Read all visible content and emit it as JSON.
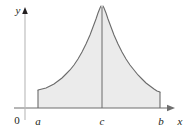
{
  "figure": {
    "background_color": "#ffffff",
    "axis_color": "#6f6f6f",
    "curve_color": "#6b6b6b",
    "fill_color": "#ebebeb",
    "label_color": "#231f20"
  },
  "axes": {
    "y_axis": {
      "label": "y",
      "has_arrow": true,
      "x_pixel": 25,
      "top_pixel": 7,
      "bottom_pixel": 120
    },
    "x_axis": {
      "label": "x",
      "has_arrow": true,
      "y_pixel": 108,
      "left_pixel": 14,
      "right_pixel": 175
    },
    "origin": {
      "label": "0"
    }
  },
  "tick_labels": [
    {
      "name": "a",
      "label": "a",
      "x_pixel": 38
    },
    {
      "name": "c",
      "label": "c",
      "x_pixel": 102
    },
    {
      "name": "b",
      "label": "b",
      "x_pixel": 160
    }
  ],
  "chart_data": {
    "type": "area",
    "title": "",
    "xlabel": "x",
    "ylabel": "y",
    "grid": false,
    "legend": null,
    "xlim": [
      25,
      175
    ],
    "ylim": [
      0,
      108
    ],
    "annotations": [
      {
        "text": "vertical asymptote at x = c",
        "x_pixel": 102
      },
      {
        "text": "shaded region from a to b",
        "x_pixel": 99
      }
    ],
    "asymptote": {
      "x_pixel": 102,
      "top_pixel": 7,
      "bottom_pixel": 108
    },
    "series": [
      {
        "name": "left-branch",
        "comment": "rises from plateau at a up to asymptote at c",
        "points_pixel": [
          [
            38,
            90
          ],
          [
            42,
            89
          ],
          [
            46,
            88
          ],
          [
            50,
            86
          ],
          [
            54,
            84
          ],
          [
            58,
            81
          ],
          [
            62,
            78
          ],
          [
            66,
            74
          ],
          [
            70,
            70
          ],
          [
            74,
            65
          ],
          [
            78,
            59
          ],
          [
            82,
            52
          ],
          [
            86,
            44
          ],
          [
            90,
            35
          ],
          [
            93,
            27
          ],
          [
            96,
            19
          ],
          [
            98,
            13
          ],
          [
            100,
            8
          ],
          [
            101,
            6
          ]
        ]
      },
      {
        "name": "right-branch",
        "comment": "descends from asymptote at c down to plateau at b",
        "points_pixel": [
          [
            103,
            6
          ],
          [
            104,
            8
          ],
          [
            106,
            13
          ],
          [
            108,
            19
          ],
          [
            111,
            27
          ],
          [
            114,
            35
          ],
          [
            118,
            44
          ],
          [
            122,
            52
          ],
          [
            126,
            59
          ],
          [
            130,
            65
          ],
          [
            134,
            70
          ],
          [
            138,
            75
          ],
          [
            142,
            79
          ],
          [
            146,
            83
          ],
          [
            150,
            86
          ],
          [
            154,
            89
          ],
          [
            157,
            91
          ],
          [
            160,
            92
          ]
        ]
      }
    ],
    "vertical_edges": [
      {
        "name": "left-edge-at-a",
        "x_pixel": 38,
        "y_top_pixel": 90,
        "y_bottom_pixel": 108
      },
      {
        "name": "right-edge-at-b",
        "x_pixel": 160,
        "y_top_pixel": 92,
        "y_bottom_pixel": 108
      }
    ]
  }
}
